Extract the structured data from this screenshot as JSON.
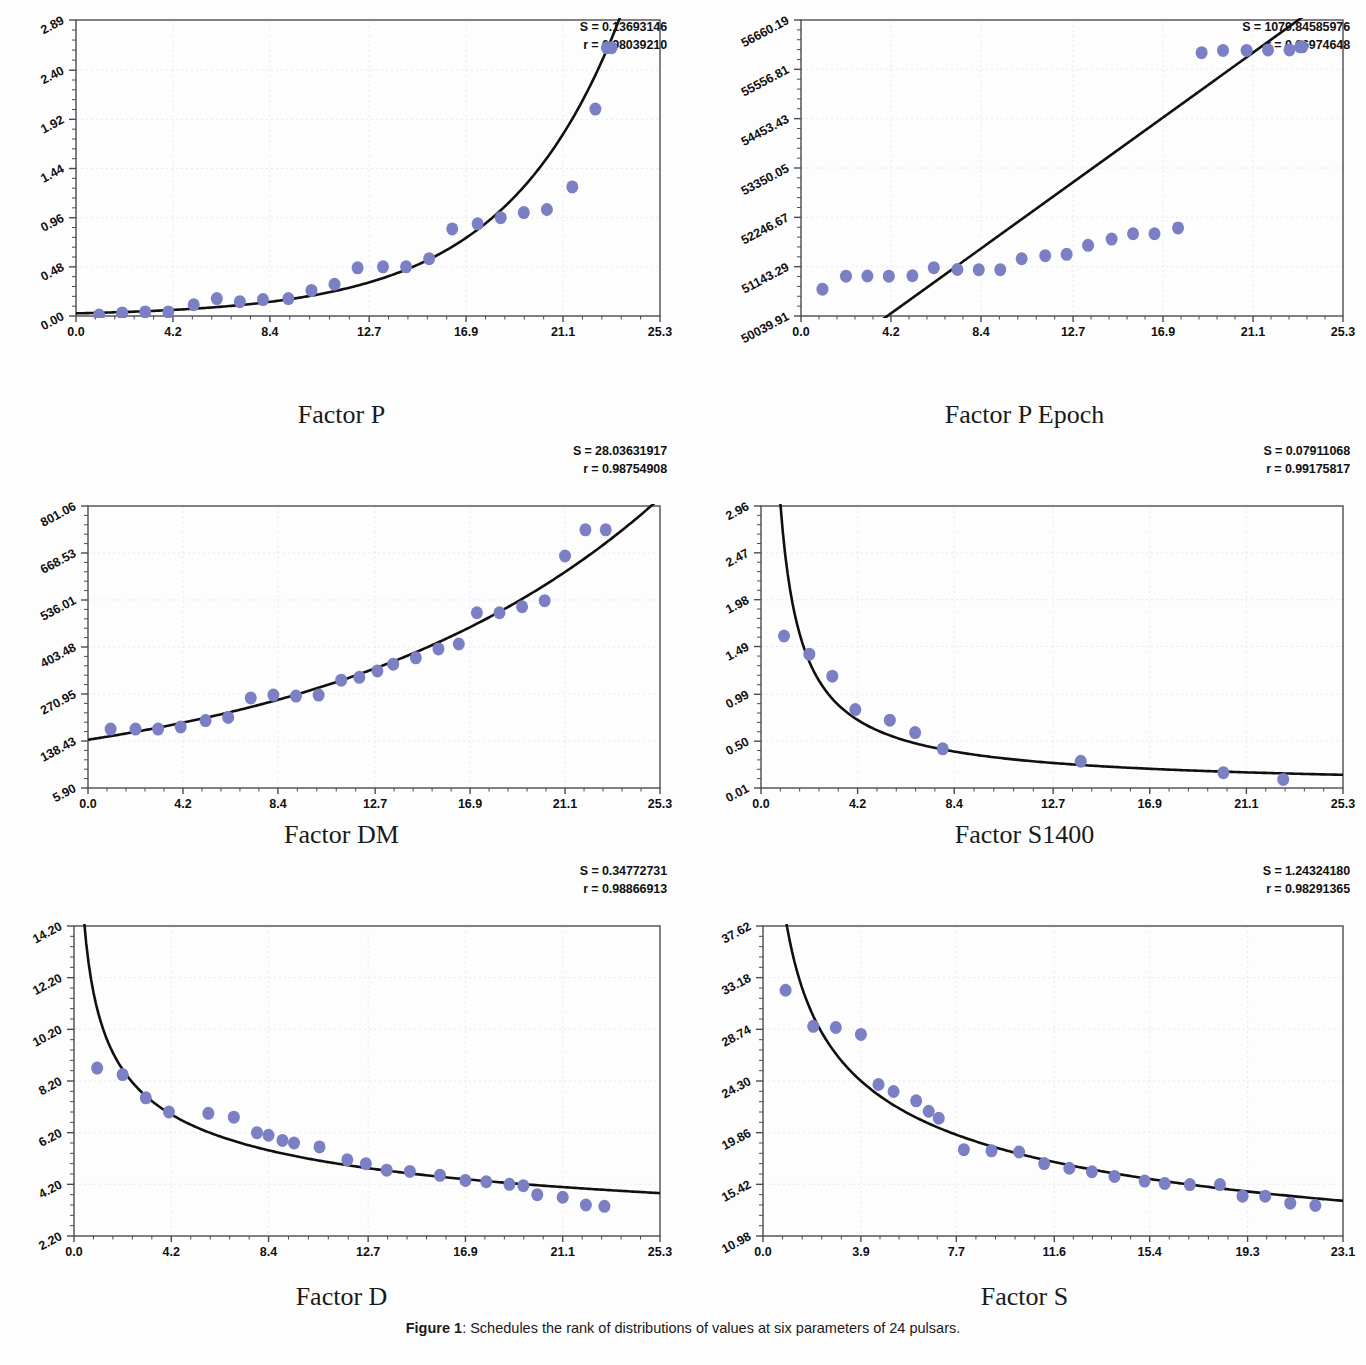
{
  "caption": {
    "label": "Figure 1",
    "separator": ": ",
    "text": "Schedules the rank of distributions of values at six parameters of 24 pulsars."
  },
  "style": {
    "marker_color": "#7b7fc4",
    "curve_color": "#101010",
    "axis_color": "#4a4a55",
    "grid_color": "#e8e8f0",
    "background": "#fdfdfd"
  },
  "chart_data": [
    {
      "type": "scatter",
      "panel": "top-left",
      "title": "",
      "xlabel": "Factor P",
      "ylabel": "",
      "stat_s_label": "S = 0.13693146",
      "stat_r_label": "r = 0.98039210",
      "s_value": 0.13693146,
      "r_value": 0.9803921,
      "xlim": [
        0.0,
        25.3
      ],
      "ylim": [
        0.0,
        2.89
      ],
      "xticks": [
        "0.0",
        "4.2",
        "8.4",
        "12.7",
        "16.9",
        "21.1",
        "25.3"
      ],
      "xtick_values": [
        0.0,
        4.2,
        8.4,
        12.7,
        16.9,
        21.1,
        25.3
      ],
      "yticks": [
        "0.00",
        "0.48",
        "0.96",
        "1.44",
        "1.92",
        "2.40",
        "2.89"
      ],
      "ytick_values": [
        0.0,
        0.48,
        0.96,
        1.44,
        1.92,
        2.4,
        2.89
      ],
      "grid": true,
      "legend": "none",
      "x": [
        1.0,
        2.0,
        3.0,
        4.0,
        5.1,
        6.1,
        7.1,
        8.1,
        9.2,
        10.2,
        11.2,
        12.2,
        13.3,
        14.3,
        15.3,
        16.3,
        17.4,
        18.4,
        19.4,
        20.4,
        21.5,
        22.5,
        23.0,
        23.2
      ],
      "y": [
        0.01,
        0.03,
        0.04,
        0.04,
        0.11,
        0.17,
        0.14,
        0.16,
        0.17,
        0.25,
        0.31,
        0.47,
        0.48,
        0.48,
        0.56,
        0.85,
        0.9,
        0.96,
        1.01,
        1.04,
        1.26,
        2.02,
        2.62,
        2.62
      ],
      "fit_curve": {
        "form": "exponential",
        "a": 0.11,
        "b": 0.145,
        "note": "y = a*exp(b*x) rising through data"
      }
    },
    {
      "type": "scatter",
      "panel": "top-right",
      "title": "",
      "xlabel": "Factor P Epoch",
      "ylabel": "",
      "stat_s_label": "S = 1079.84585976",
      "stat_r_label": "r = 0.86974648",
      "s_value": 1079.84585976,
      "r_value": 0.86974648,
      "xlim": [
        0.0,
        25.3
      ],
      "ylim": [
        50039.91,
        56660.19
      ],
      "xticks": [
        "0.0",
        "4.2",
        "8.4",
        "12.7",
        "16.9",
        "21.1",
        "25.3"
      ],
      "xtick_values": [
        0.0,
        4.2,
        8.4,
        12.7,
        16.9,
        21.1,
        25.3
      ],
      "yticks": [
        "50039.91",
        "51143.29",
        "52246.67",
        "53350.05",
        "54453.43",
        "55556.81",
        "56660.19"
      ],
      "ytick_values": [
        50039.91,
        51143.29,
        52246.67,
        53350.05,
        54453.43,
        55556.81,
        56660.19
      ],
      "grid": true,
      "legend": "none",
      "x": [
        1.0,
        2.1,
        3.1,
        4.1,
        5.2,
        6.2,
        7.3,
        8.3,
        9.3,
        10.3,
        11.4,
        12.4,
        13.4,
        14.5,
        15.5,
        16.5,
        17.6,
        18.7,
        19.7,
        20.8,
        21.8,
        22.8,
        23.3,
        23.4
      ],
      "y": [
        50640.0,
        50930.0,
        50935.0,
        50930.0,
        50940.0,
        51120.0,
        51080.0,
        51075.0,
        51075.0,
        51320.0,
        51390.0,
        51420.0,
        51620.0,
        51760.0,
        51880.0,
        51880.0,
        52010.0,
        55930.0,
        55980.0,
        55980.0,
        55990.0,
        55990.0,
        56060.0,
        56060.0
      ],
      "fit_curve": {
        "form": "linear",
        "intercept": 48650.0,
        "slope": 345.0,
        "note": "straight regression line crossing plot"
      }
    },
    {
      "type": "scatter",
      "panel": "middle-left",
      "title": "",
      "xlabel": "Factor DM",
      "ylabel": "",
      "stat_s_label": "S = 28.03631917",
      "stat_r_label": "r = 0.98754908",
      "s_value": 28.03631917,
      "r_value": 0.98754908,
      "xlim": [
        0.0,
        25.3
      ],
      "ylim": [
        5.9,
        801.06
      ],
      "xticks": [
        "0.0",
        "4.2",
        "8.4",
        "12.7",
        "16.9",
        "21.1",
        "25.3"
      ],
      "xtick_values": [
        0.0,
        4.2,
        8.4,
        12.7,
        16.9,
        21.1,
        25.3
      ],
      "yticks": [
        "5.90",
        "138.43",
        "270.95",
        "403.48",
        "536.01",
        "668.53",
        "801.06"
      ],
      "ytick_values": [
        5.9,
        138.43,
        270.95,
        403.48,
        536.01,
        668.53,
        801.06
      ],
      "grid": true,
      "legend": "none",
      "x": [
        1.0,
        2.1,
        3.1,
        4.1,
        5.2,
        6.2,
        7.2,
        8.2,
        9.2,
        10.2,
        11.2,
        12.0,
        12.8,
        13.5,
        14.5,
        15.5,
        16.4,
        17.2,
        18.2,
        19.2,
        20.2,
        21.1,
        22.0,
        22.9
      ],
      "y": [
        172.0,
        172.0,
        172.0,
        178.0,
        196.0,
        205.0,
        260.0,
        268.0,
        265.0,
        268.0,
        310.0,
        318.0,
        336.0,
        355.0,
        373.0,
        398.0,
        412.0,
        500.0,
        500.0,
        517.0,
        534.0,
        660.0,
        734.0,
        734.0
      ],
      "fit_curve": {
        "form": "exponential",
        "a": 138.0,
        "b": 0.073,
        "note": "rising exponential through cloud"
      }
    },
    {
      "type": "scatter",
      "panel": "middle-right",
      "title": "",
      "xlabel": "Factor S1400",
      "ylabel": "",
      "stat_s_label": "S = 0.07911068",
      "stat_r_label": "r = 0.99175817",
      "s_value": 0.07911068,
      "r_value": 0.99175817,
      "xlim": [
        0.0,
        25.3
      ],
      "ylim": [
        0.01,
        2.96
      ],
      "xticks": [
        "0.0",
        "4.2",
        "8.4",
        "12.7",
        "16.9",
        "21.1",
        "25.3"
      ],
      "xtick_values": [
        0.0,
        4.2,
        8.4,
        12.7,
        16.9,
        21.1,
        25.3
      ],
      "yticks": [
        "0.01",
        "0.50",
        "0.99",
        "1.49",
        "1.98",
        "2.47",
        "2.96"
      ],
      "ytick_values": [
        0.01,
        0.5,
        0.99,
        1.49,
        1.98,
        2.47,
        2.96
      ],
      "grid": true,
      "legend": "none",
      "x": [
        1.0,
        2.1,
        3.1,
        4.1,
        5.6,
        6.7,
        7.9,
        13.9,
        20.1,
        22.7
      ],
      "y": [
        1.6,
        1.41,
        1.18,
        0.83,
        0.72,
        0.59,
        0.42,
        0.29,
        0.17,
        0.1
      ],
      "fit_curve": {
        "form": "power-decay",
        "note": "steep decaying curve from y~2.6 at x=0 flattening near 0.08"
      }
    },
    {
      "type": "scatter",
      "panel": "bottom-left",
      "title": "",
      "xlabel": "Factor D",
      "ylabel": "",
      "stat_s_label": "S = 0.34772731",
      "stat_r_label": "r = 0.98866913",
      "s_value": 0.34772731,
      "r_value": 0.98866913,
      "xlim": [
        0.0,
        25.3
      ],
      "ylim": [
        2.2,
        14.2
      ],
      "xticks": [
        "0.0",
        "4.2",
        "8.4",
        "12.7",
        "16.9",
        "21.1",
        "25.3"
      ],
      "xtick_values": [
        0.0,
        4.2,
        8.4,
        12.7,
        16.9,
        21.1,
        25.3
      ],
      "yticks": [
        "2.20",
        "4.20",
        "6.20",
        "8.20",
        "10.20",
        "12.20",
        "14.20"
      ],
      "ytick_values": [
        2.2,
        4.2,
        6.2,
        8.2,
        10.2,
        12.2,
        14.2
      ],
      "grid": true,
      "legend": "none",
      "x": [
        1.0,
        2.1,
        3.1,
        4.1,
        5.8,
        6.9,
        7.9,
        9.5,
        10.6,
        11.8,
        13.5,
        15.8,
        16.9,
        17.8,
        18.8,
        20.0,
        21.1,
        22.1,
        22.9,
        12.6,
        14.5,
        19.4,
        9.0,
        8.4
      ],
      "y": [
        8.7,
        8.45,
        7.55,
        7.0,
        6.95,
        6.8,
        6.2,
        5.8,
        5.65,
        5.15,
        4.75,
        4.55,
        4.35,
        4.3,
        4.2,
        3.8,
        3.7,
        3.4,
        3.35,
        5.0,
        4.7,
        4.15,
        5.9,
        6.1
      ],
      "fit_curve": {
        "form": "power-decay",
        "note": "decaying curve from y~13.3 at x=0 to ~3.6 at x=25.3"
      }
    },
    {
      "type": "scatter",
      "panel": "bottom-right",
      "title": "",
      "xlabel": "Factor S",
      "ylabel": "",
      "stat_s_label": "S = 1.24324180",
      "stat_r_label": "r = 0.98291365",
      "s_value": 1.2432418,
      "r_value": 0.98291365,
      "xlim": [
        0.0,
        23.1
      ],
      "ylim": [
        10.98,
        37.62
      ],
      "xticks": [
        "0.0",
        "3.9",
        "7.7",
        "11.6",
        "15.4",
        "19.3",
        "23.1"
      ],
      "xtick_values": [
        0.0,
        3.9,
        7.7,
        11.6,
        15.4,
        19.3,
        23.1
      ],
      "yticks": [
        "10.98",
        "15.42",
        "19.86",
        "24.30",
        "28.74",
        "33.18",
        "37.62"
      ],
      "ytick_values": [
        10.98,
        15.42,
        19.86,
        24.3,
        28.74,
        33.18,
        37.62
      ],
      "grid": true,
      "legend": "none",
      "x": [
        0.9,
        2.0,
        2.9,
        3.9,
        5.2,
        6.1,
        7.0,
        8.0,
        9.1,
        10.2,
        11.2,
        12.2,
        13.1,
        15.2,
        17.0,
        18.2,
        19.1,
        20.0,
        21.0,
        4.6,
        14.0,
        16.0,
        22.0,
        6.6
      ],
      "y": [
        32.1,
        29.0,
        28.9,
        28.3,
        23.4,
        22.6,
        21.1,
        18.4,
        18.3,
        18.2,
        17.2,
        16.8,
        16.5,
        15.7,
        15.4,
        15.4,
        14.4,
        14.4,
        13.8,
        24.0,
        16.1,
        15.5,
        13.6,
        21.7
      ],
      "fit_curve": {
        "form": "power-decay",
        "note": "decaying curve from y~36.4 at x=0 to ~11.8 at x=23.1"
      }
    }
  ]
}
